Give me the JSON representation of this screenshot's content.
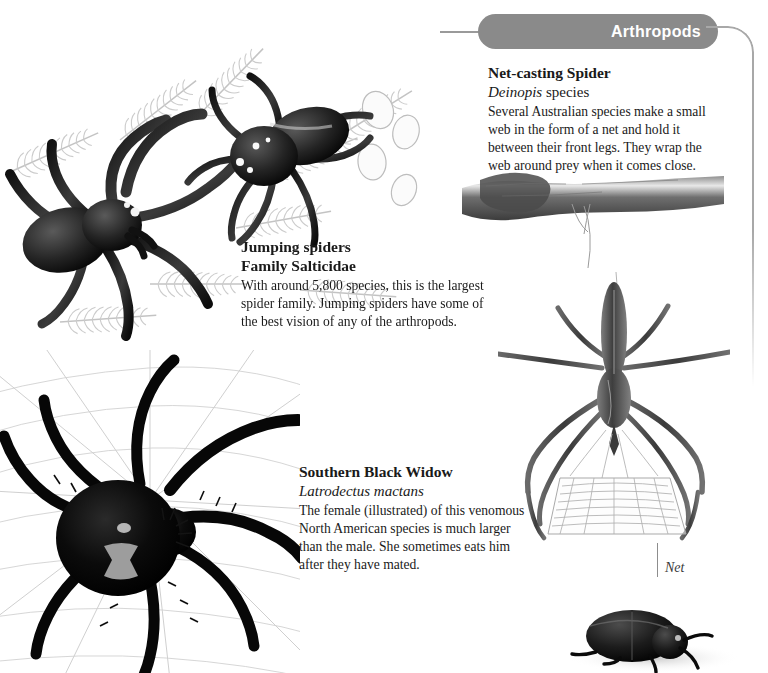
{
  "section": {
    "tab_label": "Arthropods"
  },
  "figures": {
    "net_casting": {
      "title": "Net-casting Spider",
      "subtitle_italic": "Deinopis",
      "subtitle_rest": " species",
      "body": "Several Australian species make a small web in the form of a net and hold it between their front legs. They wrap the web around prey when it comes close.",
      "callout_label": "Net"
    },
    "jumping": {
      "title": "Jumping spiders",
      "subtitle": "Family Salticidae",
      "body": "With around 5,800 species, this is the largest spider family. Jumping spiders have some of the best vision of any of the arthropods."
    },
    "black_widow": {
      "title": "Southern Black Widow",
      "subtitle": "Latrodectus mactans",
      "body": "The female (illustrated) of this venomous North American species is much larger than the male. She sometimes eats him after they have mated."
    }
  },
  "illustrations": [
    {
      "name": "jumping-spider-large-illustration"
    },
    {
      "name": "jumping-spider-small-illustration"
    },
    {
      "name": "black-widow-illustration"
    },
    {
      "name": "net-casting-spider-illustration"
    },
    {
      "name": "branch-illustration"
    },
    {
      "name": "beetle-illustration"
    }
  ],
  "colors": {
    "tab_background": "#8a8a8a",
    "tab_text": "#ffffff",
    "border_rule": "#a8a8a8",
    "page_background": "#ffffff",
    "text": "#1a1a1a"
  }
}
